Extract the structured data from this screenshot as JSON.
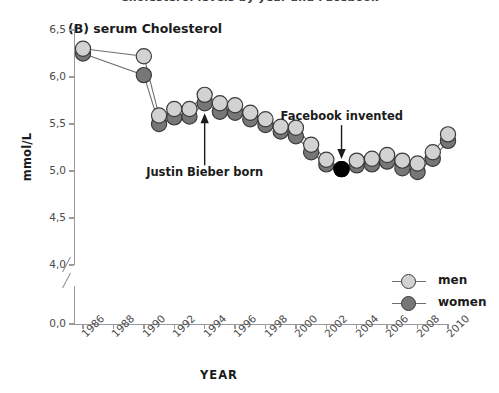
{
  "figure": {
    "top_title": "Cholesterol levels by year and Facebook",
    "panel_label": "(B) serum Cholesterol",
    "ylabel": "mmol/L",
    "xlabel": "YEAR"
  },
  "legend": {
    "position": "bottom-right",
    "items": [
      {
        "label": "men",
        "color": "#d2d2d2"
      },
      {
        "label": "women",
        "color": "#777777"
      }
    ]
  },
  "annotations": [
    {
      "name": "justin-bieber-born",
      "text": "Justin Bieber born",
      "arrow": "up",
      "target_year": 1994,
      "target_value": 5.72
    },
    {
      "name": "facebook-invented",
      "text": "Facebook invented",
      "arrow": "down",
      "target_year": 2003,
      "target_value": 5.02
    }
  ],
  "colors": {
    "men": "#d2d2d2",
    "women": "#777777",
    "highlight": "#000000",
    "marker_edge": "#3a3a3a",
    "line": "#6f6f6f",
    "axis": "#9a9a9a",
    "text": "#1b1b1b"
  },
  "chart_data": {
    "type": "line",
    "title": "(B) serum Cholesterol",
    "xlabel": "YEAR",
    "ylabel": "mmol/L",
    "grid": false,
    "legend_position": "bottom-right",
    "xlim": [
      1985,
      2011
    ],
    "ylim": [
      3.85,
      6.65
    ],
    "ytick_labels": [
      "0,0",
      "4,0",
      "4,5",
      "5,0",
      "5,5",
      "6,0",
      "6,5"
    ],
    "ytick_values": [
      0.0,
      4.0,
      4.5,
      5.0,
      5.5,
      6.0,
      6.5
    ],
    "y_axis_break": true,
    "y_axis_break_between": [
      0.0,
      4.0
    ],
    "xtick_labels": [
      "1986",
      "1988",
      "1990",
      "1992",
      "1994",
      "1996",
      "1998",
      "2000",
      "2002",
      "2004",
      "2006",
      "2008",
      "2010"
    ],
    "xtick_values": [
      1986,
      1988,
      1990,
      1992,
      1994,
      1996,
      1998,
      2000,
      2002,
      2004,
      2006,
      2008,
      2010
    ],
    "x": [
      1986,
      1990,
      1991,
      1992,
      1993,
      1994,
      1995,
      1996,
      1997,
      1998,
      1999,
      2000,
      2001,
      2002,
      2003,
      2004,
      2005,
      2006,
      2007,
      2008,
      2009,
      2010
    ],
    "series": [
      {
        "name": "men",
        "color": "#d2d2d2",
        "values": [
          6.3,
          6.22,
          5.59,
          5.66,
          5.66,
          5.81,
          5.72,
          5.7,
          5.62,
          5.55,
          5.47,
          5.46,
          5.28,
          5.12,
          5.02,
          5.11,
          5.13,
          5.17,
          5.11,
          5.08,
          5.2,
          5.39
        ]
      },
      {
        "name": "women",
        "color": "#777777",
        "values": [
          6.25,
          6.02,
          5.5,
          5.57,
          5.58,
          5.72,
          5.63,
          5.62,
          5.55,
          5.49,
          5.42,
          5.37,
          5.2,
          5.07,
          5.02,
          5.06,
          5.07,
          5.1,
          5.03,
          4.99,
          5.13,
          5.32
        ]
      }
    ],
    "highlighted_points": [
      {
        "series": "men",
        "x": 2003,
        "y": 5.02,
        "color": "#000000"
      },
      {
        "series": "women",
        "x": 2003,
        "y": 5.02,
        "color": "#000000"
      }
    ]
  }
}
